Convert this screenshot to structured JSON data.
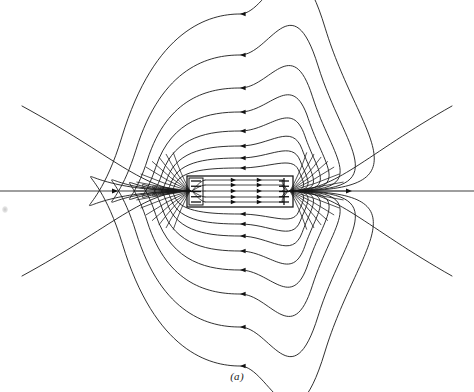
{
  "figure": {
    "caption": "(a)",
    "background_color": "#ffffff",
    "line_color": "#1a1a1a",
    "arrow_color": "#111111"
  },
  "magnet": {
    "label": "solenoid-body",
    "x": 187,
    "y": 176,
    "width": 106,
    "height": 31,
    "left_cap_label": "winding-dashes-left",
    "right_cap_label": "winding-crosses-right",
    "left_dash_count": 5,
    "right_cross_count": 5
  },
  "chart_data": {
    "type": "line",
    "subtitle": "(a)",
    "xlabel": "",
    "ylabel": "",
    "grid": false,
    "legend": null,
    "xlim": [
      0,
      474
    ],
    "ylim": [
      0,
      392
    ],
    "axis_y": 191,
    "pole_left_x": 190,
    "pole_right_x": 290,
    "interior_arrow_direction": "right",
    "exterior_return_direction": "left",
    "annotations": [
      "(a)"
    ],
    "series": [
      {
        "name": "axis-line-left",
        "kind": "straight",
        "points": [
          [
            0,
            191
          ],
          [
            187,
            191
          ]
        ],
        "arrows": [
          {
            "x": 118,
            "y": 191,
            "angle": 0
          }
        ]
      },
      {
        "name": "axis-line-right",
        "kind": "straight",
        "points": [
          [
            293,
            191
          ],
          [
            474,
            191
          ]
        ],
        "arrows": [
          {
            "x": 352,
            "y": 191,
            "angle": 0
          }
        ]
      },
      {
        "name": "interior-line-1",
        "kind": "straight",
        "points": [
          [
            205,
            180
          ],
          [
            283,
            180
          ]
        ],
        "arrows": [
          {
            "x": 236,
            "y": 180,
            "angle": 0
          },
          {
            "x": 262,
            "y": 180,
            "angle": 0
          }
        ]
      },
      {
        "name": "interior-line-2",
        "kind": "straight",
        "points": [
          [
            205,
            185
          ],
          [
            283,
            185
          ]
        ],
        "arrows": [
          {
            "x": 236,
            "y": 185,
            "angle": 0
          },
          {
            "x": 262,
            "y": 185,
            "angle": 0
          }
        ]
      },
      {
        "name": "interior-line-3",
        "kind": "straight",
        "points": [
          [
            205,
            191
          ],
          [
            283,
            191
          ]
        ],
        "arrows": [
          {
            "x": 236,
            "y": 191,
            "angle": 0
          },
          {
            "x": 262,
            "y": 191,
            "angle": 0
          }
        ]
      },
      {
        "name": "interior-line-4",
        "kind": "straight",
        "points": [
          [
            205,
            197
          ],
          [
            283,
            197
          ]
        ],
        "arrows": [
          {
            "x": 236,
            "y": 197,
            "angle": 0
          },
          {
            "x": 262,
            "y": 197,
            "angle": 0
          }
        ]
      },
      {
        "name": "interior-line-5",
        "kind": "straight",
        "points": [
          [
            205,
            202
          ],
          [
            283,
            202
          ]
        ],
        "arrows": [
          {
            "x": 236,
            "y": 202,
            "angle": 0
          },
          {
            "x": 262,
            "y": 202,
            "angle": 0
          }
        ]
      },
      {
        "name": "loop-inner-top-1",
        "kind": "loop",
        "half": "top",
        "apex_y": 168,
        "arrow_top": {
          "x": 240,
          "y": 168,
          "angle": 180
        }
      },
      {
        "name": "loop-inner-top-2",
        "kind": "loop",
        "half": "top",
        "apex_y": 158,
        "arrow_top": {
          "x": 240,
          "y": 158,
          "angle": 180
        }
      },
      {
        "name": "loop-top-3",
        "kind": "loop",
        "half": "top",
        "apex_y": 146,
        "arrow_top": {
          "x": 240,
          "y": 146,
          "angle": 180
        }
      },
      {
        "name": "loop-top-4",
        "kind": "loop",
        "half": "top",
        "apex_y": 131,
        "arrow_top": {
          "x": 240,
          "y": 131,
          "angle": 180
        }
      },
      {
        "name": "loop-top-5",
        "kind": "loop",
        "half": "top",
        "apex_y": 112,
        "arrow_top": {
          "x": 240,
          "y": 112,
          "angle": 180
        }
      },
      {
        "name": "loop-top-6",
        "kind": "loop",
        "half": "top",
        "apex_y": 88,
        "arrow_top": {
          "x": 240,
          "y": 88,
          "angle": 180
        }
      },
      {
        "name": "loop-top-7",
        "kind": "loop",
        "half": "top",
        "apex_y": 55,
        "arrow_top": {
          "x": 240,
          "y": 55,
          "angle": 180
        }
      },
      {
        "name": "loop-top-8",
        "kind": "loop",
        "half": "top",
        "apex_y": 14,
        "arrow_top": {
          "x": 240,
          "y": 14,
          "angle": 180
        }
      },
      {
        "name": "loop-inner-bottom-1",
        "kind": "loop",
        "half": "bottom",
        "apex_y": 214,
        "arrow_bottom": {
          "x": 240,
          "y": 214,
          "angle": 180
        }
      },
      {
        "name": "loop-inner-bottom-2",
        "kind": "loop",
        "half": "bottom",
        "apex_y": 224,
        "arrow_bottom": {
          "x": 240,
          "y": 224,
          "angle": 180
        }
      },
      {
        "name": "loop-bottom-3",
        "kind": "loop",
        "half": "bottom",
        "apex_y": 236,
        "arrow_bottom": {
          "x": 240,
          "y": 236,
          "angle": 180
        }
      },
      {
        "name": "loop-bottom-4",
        "kind": "loop",
        "half": "bottom",
        "apex_y": 251,
        "arrow_bottom": {
          "x": 240,
          "y": 251,
          "angle": 180
        }
      },
      {
        "name": "loop-bottom-5",
        "kind": "loop",
        "half": "bottom",
        "apex_y": 270,
        "arrow_bottom": {
          "x": 240,
          "y": 270,
          "angle": 180
        }
      },
      {
        "name": "loop-bottom-6",
        "kind": "loop",
        "half": "bottom",
        "apex_y": 294,
        "arrow_bottom": {
          "x": 240,
          "y": 294,
          "angle": 180
        }
      },
      {
        "name": "loop-bottom-7",
        "kind": "loop",
        "half": "bottom",
        "apex_y": 327,
        "arrow_bottom": {
          "x": 240,
          "y": 327,
          "angle": 180
        }
      },
      {
        "name": "loop-bottom-8",
        "kind": "loop",
        "half": "bottom",
        "apex_y": 366,
        "arrow_bottom": {
          "x": 240,
          "y": 366,
          "angle": 180
        }
      },
      {
        "name": "open-line-upper-left",
        "kind": "open",
        "quadrant": "upper-left",
        "end": [
          22,
          106
        ]
      },
      {
        "name": "open-line-lower-left",
        "kind": "open",
        "quadrant": "lower-left",
        "end": [
          22,
          276
        ]
      },
      {
        "name": "open-line-upper-right",
        "kind": "open",
        "quadrant": "upper-right",
        "end": [
          452,
          106
        ]
      },
      {
        "name": "open-line-lower-right",
        "kind": "open",
        "quadrant": "lower-right",
        "end": [
          452,
          276
        ]
      }
    ]
  }
}
